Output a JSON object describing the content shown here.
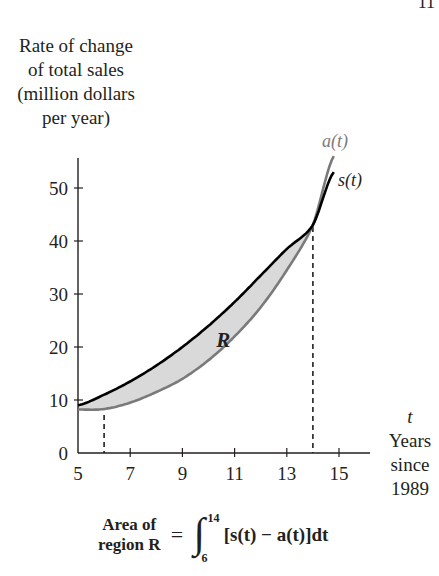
{
  "page": {
    "page_number_fragment": "11"
  },
  "chart_data": {
    "type": "line",
    "title": "",
    "ylabel": "Rate of change of total sales (million dollars per year)",
    "ylabel_lines": [
      "Rate of change",
      "of total sales",
      "(million dollars",
      "per year)"
    ],
    "xlabel": "t Years since 1989",
    "xlabel_lines": [
      "t",
      "Years",
      "since",
      "1989"
    ],
    "xlim": [
      5,
      15.2
    ],
    "ylim": [
      0,
      56
    ],
    "x_ticks": [
      5,
      7,
      9,
      11,
      13,
      15
    ],
    "y_ticks": [
      0,
      10,
      20,
      30,
      40,
      50
    ],
    "grid": false,
    "series": [
      {
        "name": "s(t)",
        "label": "s(t)",
        "color": "#000000",
        "x": [
          5,
          6,
          7,
          8,
          9,
          10,
          11,
          12,
          13,
          14,
          14.8
        ],
        "values": [
          9,
          11,
          13.5,
          16.5,
          20,
          24,
          28.5,
          33.5,
          38.5,
          43,
          53
        ]
      },
      {
        "name": "a(t)",
        "label": "a(t)",
        "color": "#7a7a7a",
        "x": [
          5,
          6,
          7,
          8,
          9,
          10,
          11,
          12,
          13,
          14,
          14.8
        ],
        "values": [
          8.2,
          8.3,
          9.5,
          11.5,
          14,
          17.5,
          22,
          27.5,
          34.5,
          43,
          56
        ]
      }
    ],
    "shaded_region": {
      "label": "R",
      "between": [
        "s(t)",
        "a(t)"
      ],
      "from": 6,
      "to": 14,
      "color": "#d9d9d9"
    },
    "reference_lines": [
      {
        "type": "vertical-dashed",
        "x": 6
      },
      {
        "type": "vertical-dashed",
        "x": 14
      }
    ],
    "annotations": [
      {
        "text": "R",
        "x": 10.3,
        "y": 20
      },
      {
        "text": "a(t)",
        "x": 14.9,
        "y": 58
      },
      {
        "text": "s(t)",
        "x": 15.2,
        "y": 53
      }
    ]
  },
  "formula": {
    "lhs_line1": "Area of",
    "lhs_line2": "region R",
    "equals": "=",
    "integral_sign": "∫",
    "upper_limit": "14",
    "lower_limit": "6",
    "integrand": "[s(t) − a(t)]dt"
  }
}
